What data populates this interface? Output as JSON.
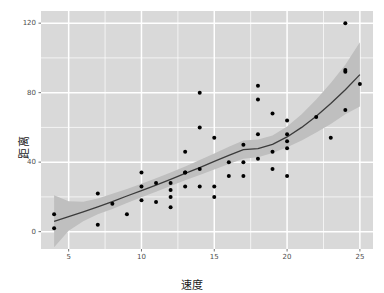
{
  "chart_data": {
    "type": "scatter",
    "title": "",
    "xlabel": "速度",
    "ylabel": "距离",
    "xlim": [
      3.1,
      25.9
    ],
    "ylim": [
      -10.0,
      127.0
    ],
    "xticks": [
      5,
      10,
      15,
      20,
      25
    ],
    "yticks": [
      0,
      40,
      80,
      120
    ],
    "xtick_labels": [
      "5",
      "10",
      "15",
      "20",
      "25"
    ],
    "ytick_labels": [
      "0",
      "40",
      "80",
      "120"
    ],
    "grid": true,
    "minor_grid": true,
    "legend": "none",
    "panel_background": "#d9d9d9",
    "grid_color": "#ffffff",
    "point_color": "#000000",
    "line_color": "#3b3b3b",
    "band_color": "#bfbfbf",
    "series": [
      {
        "name": "观测点",
        "type": "scatter",
        "x": [
          4,
          4,
          7,
          7,
          8,
          9,
          10,
          10,
          10,
          11,
          11,
          12,
          12,
          12,
          12,
          13,
          13,
          13,
          13,
          14,
          14,
          14,
          14,
          15,
          15,
          15,
          16,
          16,
          17,
          17,
          17,
          18,
          18,
          18,
          18,
          19,
          19,
          19,
          20,
          20,
          20,
          20,
          20,
          22,
          23,
          24,
          24,
          24,
          24,
          25
        ],
        "y": [
          2,
          10,
          4,
          22,
          16,
          10,
          18,
          26,
          34,
          17,
          28,
          14,
          20,
          24,
          28,
          26,
          34,
          34,
          46,
          26,
          36,
          60,
          80,
          20,
          26,
          54,
          32,
          40,
          32,
          40,
          50,
          42,
          56,
          76,
          84,
          36,
          46,
          68,
          32,
          48,
          52,
          56,
          64,
          66,
          54,
          70,
          92,
          93,
          120,
          85
        ]
      },
      {
        "name": "LOESS 平滑曲线",
        "type": "line",
        "x": [
          4.0,
          5.0,
          6.0,
          7.0,
          8.0,
          9.0,
          10.0,
          11.0,
          12.0,
          13.0,
          14.0,
          15.0,
          16.0,
          17.0,
          18.0,
          19.0,
          20.0,
          21.0,
          22.0,
          23.0,
          24.0,
          25.0
        ],
        "y": [
          5.9,
          8.6,
          11.4,
          14.3,
          17.3,
          20.5,
          23.6,
          26.8,
          30.1,
          33.5,
          36.9,
          40.4,
          43.9,
          47.2,
          47.8,
          50.2,
          54.5,
          60.0,
          66.4,
          73.7,
          81.7,
          90.4
        ]
      }
    ],
    "confidence_band": {
      "name": "95% 置信区间",
      "x": [
        4.0,
        5.0,
        6.0,
        7.0,
        8.0,
        9.0,
        10.0,
        11.0,
        12.0,
        13.0,
        14.0,
        15.0,
        16.0,
        17.0,
        18.0,
        19.0,
        20.0,
        21.0,
        22.0,
        23.0,
        24.0,
        25.0
      ],
      "lower": [
        -9.0,
        0.5,
        6.0,
        10.0,
        13.0,
        16.5,
        19.8,
        23.0,
        26.3,
        29.6,
        32.6,
        35.8,
        39.0,
        42.0,
        42.8,
        45.2,
        48.5,
        52.5,
        57.0,
        62.0,
        67.5,
        72.0
      ],
      "upper": [
        21.0,
        17.5,
        17.2,
        19.0,
        21.8,
        24.6,
        27.6,
        30.7,
        34.0,
        37.5,
        41.3,
        45.0,
        48.8,
        52.4,
        53.0,
        55.3,
        60.5,
        67.5,
        76.0,
        85.5,
        96.0,
        109.0
      ]
    }
  }
}
